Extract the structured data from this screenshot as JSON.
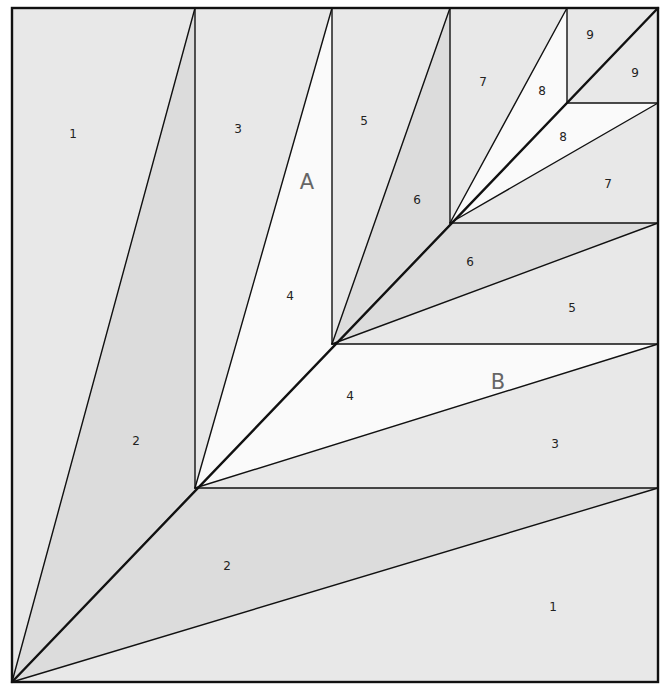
{
  "diagram": {
    "colors": {
      "light": "#e8e8e8",
      "medium": "#dcdcdc",
      "white": "#fafafa",
      "line": "#111111"
    },
    "sections": [
      {
        "name": "A",
        "x": 307,
        "y": 182
      },
      {
        "name": "B",
        "x": 498,
        "y": 382
      }
    ],
    "pieces": [
      {
        "section": "A",
        "label": "1",
        "x": 73,
        "y": 134,
        "shade": "light",
        "points": "12,8 195,8 12,682"
      },
      {
        "section": "A",
        "label": "2",
        "x": 136,
        "y": 441,
        "shade": "medium",
        "points": "195,8 195,488 12,682"
      },
      {
        "section": "A",
        "label": "3",
        "x": 238,
        "y": 129,
        "shade": "light",
        "points": "195,8 332,8 195,488"
      },
      {
        "section": "A",
        "label": "4",
        "x": 290,
        "y": 296,
        "shade": "white",
        "points": "332,8 332,344 195,488"
      },
      {
        "section": "A",
        "label": "5",
        "x": 364,
        "y": 121,
        "shade": "light",
        "points": "332,8 450,8 332,344"
      },
      {
        "section": "A",
        "label": "6",
        "x": 417,
        "y": 200,
        "shade": "medium",
        "points": "450,8 450,223 332,344"
      },
      {
        "section": "A",
        "label": "7",
        "x": 483,
        "y": 82,
        "shade": "light",
        "points": "450,8 567,8 450,223"
      },
      {
        "section": "A",
        "label": "8",
        "x": 542,
        "y": 91,
        "shade": "white",
        "points": "567,8 567,103 450,223"
      },
      {
        "section": "A",
        "label": "9",
        "x": 590,
        "y": 35,
        "shade": "light",
        "points": "567,8 658,8 567,103"
      },
      {
        "section": "B",
        "label": "1",
        "x": 553,
        "y": 607,
        "shade": "light",
        "points": "658,488 658,682 12,682"
      },
      {
        "section": "B",
        "label": "2",
        "x": 227,
        "y": 566,
        "shade": "medium",
        "points": "195,488 658,488 12,682"
      },
      {
        "section": "B",
        "label": "3",
        "x": 555,
        "y": 444,
        "shade": "light",
        "points": "658,344 658,488 195,488"
      },
      {
        "section": "B",
        "label": "4",
        "x": 350,
        "y": 396,
        "shade": "white",
        "points": "332,344 658,344 195,488"
      },
      {
        "section": "B",
        "label": "5",
        "x": 572,
        "y": 308,
        "shade": "light",
        "points": "658,223 658,344 332,344"
      },
      {
        "section": "B",
        "label": "6",
        "x": 470,
        "y": 262,
        "shade": "medium",
        "points": "450,223 658,223 332,344"
      },
      {
        "section": "B",
        "label": "7",
        "x": 608,
        "y": 184,
        "shade": "light",
        "points": "658,103 658,223 450,223"
      },
      {
        "section": "B",
        "label": "8",
        "x": 563,
        "y": 137,
        "shade": "white",
        "points": "567,103 658,103 450,223"
      },
      {
        "section": "B",
        "label": "9",
        "x": 635,
        "y": 73,
        "shade": "light",
        "points": "658,8 658,103 567,103"
      }
    ]
  }
}
